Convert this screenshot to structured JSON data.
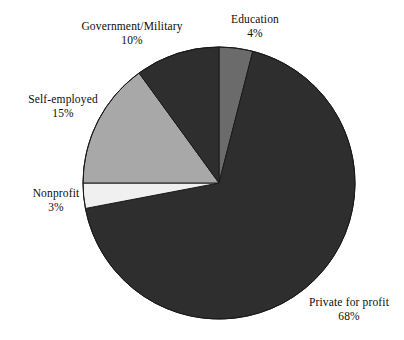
{
  "chart_data": {
    "type": "pie",
    "title": "",
    "subtitle": "",
    "xlabel": "",
    "ylabel": "",
    "legend_position": "none",
    "grid": false,
    "labels_inline": true,
    "start_angle_deg": 0,
    "direction": "clockwise",
    "categories": [
      "Education",
      "Private for profit",
      "Nonprofit",
      "Self-employed",
      "Government/Military"
    ],
    "values": [
      4,
      68,
      3,
      15,
      10
    ],
    "value_suffix": "%",
    "colors": [
      "#6b6b6b",
      "#2e2e2e",
      "#f0f0f0",
      "#a8a8a8",
      "#2e2e2e"
    ],
    "slices": [
      {
        "name": "Education",
        "value": 4,
        "value_label": "4%",
        "color": "#6b6b6b",
        "start_deg": 0,
        "end_deg": 14.4
      },
      {
        "name": "Private for profit",
        "value": 68,
        "value_label": "68%",
        "color": "#2e2e2e",
        "start_deg": 14.4,
        "end_deg": 259.2
      },
      {
        "name": "Nonprofit",
        "value": 3,
        "value_label": "3%",
        "color": "#f0f0f0",
        "start_deg": 259.2,
        "end_deg": 270
      },
      {
        "name": "Self-employed",
        "value": 15,
        "value_label": "15%",
        "color": "#a8a8a8",
        "start_deg": 270,
        "end_deg": 324
      },
      {
        "name": "Government/Military",
        "value": 10,
        "value_label": "10%",
        "color": "#2e2e2e",
        "start_deg": 324,
        "end_deg": 360
      }
    ]
  },
  "labels": {
    "government": {
      "name": "Government/Military",
      "value": "10%"
    },
    "education": {
      "name": "Education",
      "value": "4%"
    },
    "self_employed": {
      "name": "Self-employed",
      "value": "15%"
    },
    "nonprofit": {
      "name": "Nonprofit",
      "value": "3%"
    },
    "private": {
      "name": "Private for profit",
      "value": "68%"
    }
  },
  "geometry": {
    "center_x": 219,
    "center_y": 183,
    "radius": 136
  },
  "style": {
    "background": "#ffffff",
    "outline": "#1a1a1a"
  }
}
